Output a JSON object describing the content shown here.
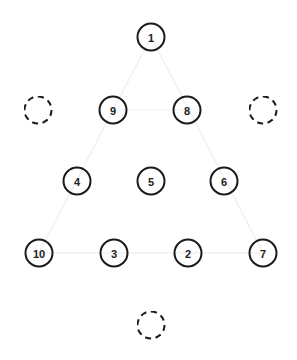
{
  "diagram": {
    "nodes": [
      {
        "label": "1",
        "x": 151,
        "y": 37,
        "type": "filled"
      },
      {
        "label": "",
        "x": 38,
        "y": 110,
        "type": "empty"
      },
      {
        "label": "9",
        "x": 113,
        "y": 110,
        "type": "filled"
      },
      {
        "label": "8",
        "x": 187,
        "y": 110,
        "type": "filled"
      },
      {
        "label": "",
        "x": 263,
        "y": 110,
        "type": "empty"
      },
      {
        "label": "4",
        "x": 77,
        "y": 181,
        "type": "filled"
      },
      {
        "label": "5",
        "x": 151,
        "y": 181,
        "type": "filled"
      },
      {
        "label": "6",
        "x": 224,
        "y": 181,
        "type": "filled"
      },
      {
        "label": "10",
        "x": 39,
        "y": 253,
        "type": "filled"
      },
      {
        "label": "3",
        "x": 114,
        "y": 253,
        "type": "filled"
      },
      {
        "label": "2",
        "x": 188,
        "y": 253,
        "type": "filled"
      },
      {
        "label": "7",
        "x": 263,
        "y": 253,
        "type": "filled"
      },
      {
        "label": "",
        "x": 151,
        "y": 325,
        "type": "empty"
      }
    ],
    "colors": {
      "stroke": "#1a1a1a",
      "text": "#222222",
      "background": "#ffffff",
      "faint_lines": "#f1f1f1"
    }
  }
}
